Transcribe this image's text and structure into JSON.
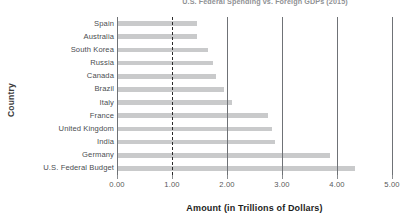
{
  "chart_data": {
    "type": "bar",
    "orientation": "horizontal",
    "title": "U.S. Federal Spending vs. Foreign GDPs (2015)",
    "xlabel": "Amount (in Trillions of Dollars)",
    "ylabel": "Country",
    "xlim": [
      0.0,
      5.0
    ],
    "xticks": [
      "0.00",
      "1.00",
      "2.00",
      "3.00",
      "4.00",
      "5.00"
    ],
    "xtick_values": [
      0.0,
      1.0,
      2.0,
      3.0,
      4.0,
      5.0
    ],
    "grid": "vertical",
    "legend": "none",
    "bar_color": "#c9cacb",
    "gridline_color": "#6f7276",
    "highlight_gridline_value": 1.0,
    "highlight_gridline_style": "dashed",
    "categories": [
      "Spain",
      "Australia",
      "South Korea",
      "Russia",
      "Canada",
      "Brazil",
      "Italy",
      "France",
      "United Kingdom",
      "India",
      "Germany",
      "U.S. Federal Budget"
    ],
    "values": [
      1.45,
      1.45,
      1.65,
      1.75,
      1.8,
      1.95,
      2.09,
      2.75,
      2.82,
      2.87,
      3.87,
      4.33
    ]
  }
}
